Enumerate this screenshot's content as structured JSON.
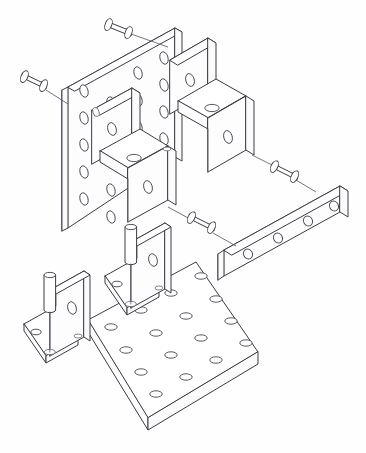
{
  "drawing": {
    "title": "Isometric Exploded Assembly",
    "type": "cad-exploded-isometric",
    "background_color": "#ffffff",
    "line_color": "#3b3b44",
    "soft_line_color": "#6a6a74",
    "canvas": {
      "width": 366,
      "height": 453
    }
  },
  "parts": [
    {
      "id": "base-plate",
      "name": "Base Plate",
      "shape": "flat rectangular plate",
      "hole_count": 16,
      "hole_grid": "4 x 4",
      "position": "bottom"
    },
    {
      "id": "vertical-plate",
      "name": "Vertical Perforated Plate",
      "shape": "flat rectangular plate standing upright",
      "hole_count": 20,
      "hole_grid": "4 columns x 5 rows",
      "position": "upper-left"
    },
    {
      "id": "u-bracket-center",
      "name": "U-Channel Bracket (center)",
      "shape": "u-channel",
      "hole_count": 3,
      "position": "center-left"
    },
    {
      "id": "u-bracket-right",
      "name": "U-Channel Bracket (right)",
      "shape": "u-channel",
      "hole_count": 3,
      "position": "upper-right"
    },
    {
      "id": "flat-bar",
      "name": "Four-Hole Flat Bar",
      "shape": "flat bar",
      "hole_count": 4,
      "position": "right"
    },
    {
      "id": "l-bracket-left",
      "name": "L-Bracket (left)",
      "shape": "angle bracket",
      "hole_count": 2,
      "position": "lower-left"
    },
    {
      "id": "l-bracket-mid",
      "name": "L-Bracket (mid)",
      "shape": "angle bracket",
      "hole_count": 2,
      "position": "lower-center"
    }
  ],
  "fasteners": [
    {
      "id": "pin-top-left",
      "name": "Dowel Pin",
      "orientation": "horizontal",
      "has_leader": true
    },
    {
      "id": "pin-left",
      "name": "Dowel Pin",
      "orientation": "horizontal",
      "has_leader": true
    },
    {
      "id": "pin-mid-right",
      "name": "Dowel Pin",
      "orientation": "horizontal",
      "has_leader": true
    },
    {
      "id": "pin-bar",
      "name": "Dowel Pin",
      "orientation": "horizontal",
      "has_leader": true
    },
    {
      "id": "pin-vertical-left",
      "name": "Vertical Dowel Pin",
      "orientation": "vertical",
      "has_leader": false
    },
    {
      "id": "pin-vertical-mid",
      "name": "Vertical Dowel Pin",
      "orientation": "vertical",
      "has_leader": false
    }
  ],
  "annotations": {
    "labels": [],
    "dimensions": [],
    "notes": []
  }
}
